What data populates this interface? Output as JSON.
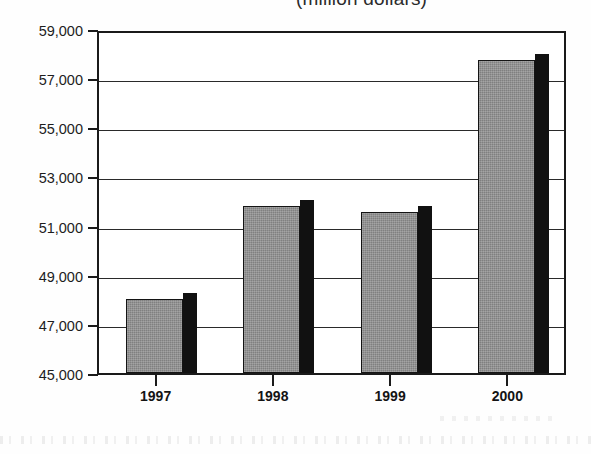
{
  "title": {
    "cropped_text": "(million dollars)"
  },
  "chart_data": {
    "type": "bar",
    "title": "(million dollars)",
    "xlabel": "",
    "ylabel": "",
    "categories": [
      "1997",
      "1998",
      "1999",
      "2000"
    ],
    "values": [
      48000,
      51800,
      51550,
      57750
    ],
    "ylim": [
      45000,
      59000
    ],
    "ytick_values": [
      45000,
      47000,
      49000,
      51000,
      53000,
      55000,
      57000,
      59000
    ],
    "ytick_labels": [
      "45,000",
      "47,000",
      "49,000",
      "51,000",
      "53,000",
      "55,000",
      "57,000",
      "59,000"
    ],
    "grid": true,
    "legend": "none",
    "series": [
      {
        "name": "value",
        "values": [
          48000,
          51800,
          51550,
          57750
        ]
      }
    ],
    "bar_style": {
      "face_color": "#808080",
      "shadow_color": "#111111",
      "edge_color": "#141414",
      "three_d": true
    }
  },
  "axes": {
    "y_ticks": [
      {
        "label": "59,000",
        "value": 59000
      },
      {
        "label": "57,000",
        "value": 57000
      },
      {
        "label": "55,000",
        "value": 55000
      },
      {
        "label": "53,000",
        "value": 53000
      },
      {
        "label": "51,000",
        "value": 51000
      },
      {
        "label": "49,000",
        "value": 49000
      },
      {
        "label": "47,000",
        "value": 47000
      },
      {
        "label": "45,000",
        "value": 45000
      }
    ],
    "x_ticks": [
      {
        "label": "1997"
      },
      {
        "label": "1998"
      },
      {
        "label": "1999"
      },
      {
        "label": "2000"
      }
    ]
  },
  "colors": {
    "bar_fill": "#808080",
    "bar_shadow": "#111111",
    "axis": "#1a1a1a",
    "grid": "#2a2a2a",
    "background": "#ffffff",
    "text": "#1d1d1d"
  }
}
